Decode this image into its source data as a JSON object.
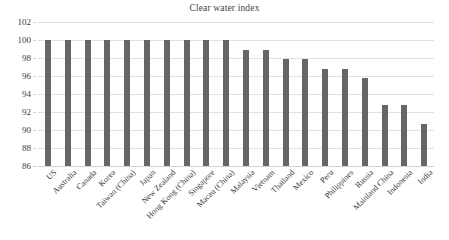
{
  "chart_data": {
    "type": "bar",
    "title": "Clear water index",
    "xlabel": "",
    "ylabel": "",
    "ylim": [
      86,
      102
    ],
    "ytick_step": 2,
    "yticks": [
      86,
      88,
      90,
      92,
      94,
      96,
      98,
      100,
      102
    ],
    "grid": true,
    "legend": false,
    "bar_color": "#666666",
    "categories": [
      "US",
      "Australia",
      "Canada",
      "Korea",
      "Taiwan (China)",
      "Japan",
      "New Zealand",
      "Hong Kong (China)",
      "Singapore",
      "Macau (China)",
      "Malaysia",
      "Vietnam",
      "Thailand",
      "Mexico",
      "Peru",
      "Philippines",
      "Russia",
      "Mainland China",
      "Indonesia",
      "India"
    ],
    "values": [
      100,
      100,
      100,
      100,
      100,
      100,
      100,
      100,
      100,
      100,
      98.9,
      98.9,
      97.9,
      97.9,
      96.8,
      96.8,
      95.8,
      92.8,
      92.8,
      90.7
    ]
  }
}
